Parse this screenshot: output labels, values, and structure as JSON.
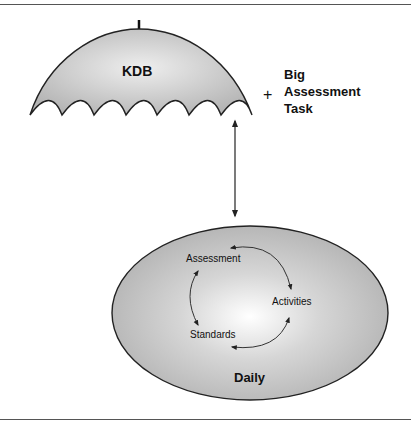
{
  "umbrella": {
    "label": "KDB",
    "scallop_count": 7,
    "fill": "#c8c8c8",
    "highlight": "#ececec"
  },
  "plus_note": {
    "symbol": "+",
    "lines": [
      "Big",
      "Assessment",
      "Task"
    ]
  },
  "connector": {
    "type": "double-headed-arrow",
    "from": "umbrella",
    "to": "daily-ellipse"
  },
  "ellipse": {
    "label": "Daily",
    "fill": "#bdbdbd",
    "highlight": "#ffffff",
    "cycle": {
      "nodes": [
        "Assessment",
        "Activities",
        "Standards"
      ],
      "edges": [
        {
          "from": "Assessment",
          "to": "Activities",
          "bidirectional": true
        },
        {
          "from": "Activities",
          "to": "Standards",
          "bidirectional": true
        },
        {
          "from": "Standards",
          "to": "Assessment",
          "bidirectional": true
        }
      ]
    }
  }
}
